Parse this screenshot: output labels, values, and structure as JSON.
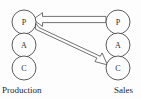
{
  "diagram": {
    "background_color": "#fdfdfd",
    "stroke_color": "#4a4a4a",
    "arrow_stroke_color": "#5a5a5a",
    "groups": [
      {
        "id": "production",
        "label": "Production",
        "side": "left",
        "nodes": [
          {
            "id": "prod-p",
            "label": "P",
            "cx": 24,
            "cy": 22,
            "r": 12
          },
          {
            "id": "prod-a",
            "label": "A",
            "cx": 24,
            "cy": 45,
            "r": 12
          },
          {
            "id": "prod-c",
            "label": "C",
            "cx": 24,
            "cy": 68,
            "r": 12
          }
        ]
      },
      {
        "id": "sales",
        "label": "Sales",
        "side": "right",
        "nodes": [
          {
            "id": "sales-p",
            "label": "P",
            "cx": 118,
            "cy": 22,
            "r": 12
          },
          {
            "id": "sales-a",
            "label": "A",
            "cx": 118,
            "cy": 45,
            "r": 12
          },
          {
            "id": "sales-c",
            "label": "C",
            "cx": 118,
            "cy": 68,
            "r": 12
          }
        ]
      }
    ],
    "arrows": [
      {
        "id": "arrow-sales-p-to-production-p",
        "from": "sales-p",
        "to": "prod-p",
        "style": "hollow-block",
        "direction": "right-to-left"
      },
      {
        "id": "arrow-production-p-to-sales-c",
        "from": "prod-p",
        "to": "sales-c",
        "style": "hollow-block",
        "direction": "diagonal-down-right"
      }
    ]
  }
}
